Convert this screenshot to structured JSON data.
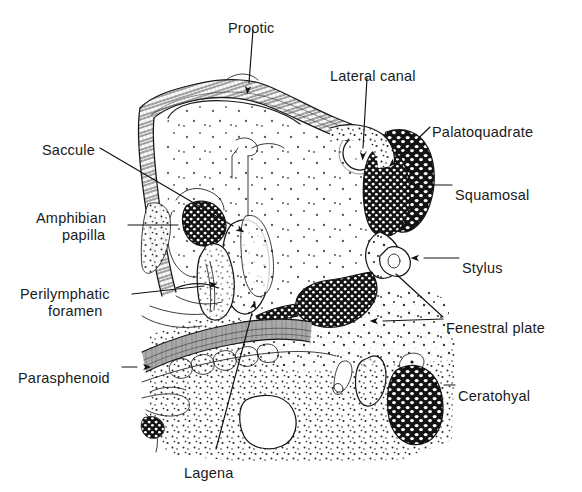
{
  "figure": {
    "kind": "scientific-line-illustration",
    "style": "black ink line drawing, stipple and hatch shading, white background",
    "width": 582,
    "height": 492,
    "background_color": "#ffffff",
    "ink_color": "#161616",
    "label_font_size_px": 14.5
  },
  "labels": [
    {
      "id": "prootic",
      "text": "Prootic",
      "x": 228,
      "y": 22,
      "anchor": "start",
      "leader": "M 253 30 L 249 83",
      "arrow": {
        "x": 248,
        "y": 86,
        "angle": 95
      }
    },
    {
      "id": "lateral-canal",
      "text": "Lateral canal",
      "x": 330,
      "y": 70,
      "anchor": "start",
      "leader": "M 367 78 L 363 148",
      "arrow": {
        "x": 363,
        "y": 152,
        "angle": 93
      }
    },
    {
      "id": "palatoquadrate",
      "text": "Palatoquadrate",
      "x": 432,
      "y": 126,
      "anchor": "start",
      "leader": "M 430 127 L 398 158",
      "arrow": {
        "x": 395,
        "y": 161,
        "angle": 136
      }
    },
    {
      "id": "squamosal",
      "text": "Squamosal",
      "x": 455,
      "y": 189,
      "anchor": "start",
      "leader": "M 452 185 L 425 185",
      "arrow": {
        "x": 421,
        "y": 185,
        "angle": 180
      }
    },
    {
      "id": "saccule",
      "text": "Saccule",
      "x": 42,
      "y": 144,
      "anchor": "start",
      "leader": "M 100 148 L 233 226",
      "arrow": {
        "x": 237,
        "y": 228,
        "angle": 30
      }
    },
    {
      "id": "amphibian-papilla",
      "text": "Amphibian",
      "text2": "papilla",
      "x": 36,
      "y": 212,
      "x2": 62,
      "y2": 229,
      "anchor": "start",
      "leader": "M 128 225 L 178 225",
      "arrow": {
        "x": 183,
        "y": 225,
        "angle": 0
      }
    },
    {
      "id": "perilymphatic-foramen",
      "text": "Perilymphatic",
      "text2": "foramen",
      "x": 20,
      "y": 288,
      "x2": 48,
      "y2": 305,
      "anchor": "start",
      "leader": "M 132 294 L 204 286",
      "arrow": {
        "x": 209,
        "y": 285,
        "angle": -6
      }
    },
    {
      "id": "parasphenoid",
      "text": "Parasphenoid",
      "x": 18,
      "y": 372,
      "anchor": "start",
      "leader": "M 122 367 L 137 367",
      "arrow": {
        "x": 143,
        "y": 367,
        "angle": 0
      }
    },
    {
      "id": "fenestral-plate",
      "text": "Fenestral  plate",
      "x": 446,
      "y": 322,
      "anchor": "start",
      "leader": "M 443 317 L 396 274 M 443 319 L 383 321",
      "arrow": {
        "x": 378,
        "y": 321,
        "angle": 180
      }
    },
    {
      "id": "stylus",
      "text": "Stylus",
      "x": 462,
      "y": 262,
      "anchor": "start",
      "leader": "M 459 258 L 424 258",
      "arrow": {
        "x": 419,
        "y": 258,
        "angle": 180
      }
    },
    {
      "id": "ceratohyal",
      "text": "Ceratohyal",
      "x": 458,
      "y": 390,
      "anchor": "start",
      "leader": "M 455 385 L 444 385",
      "arrow": {
        "x": 438,
        "y": 385,
        "angle": 180
      }
    },
    {
      "id": "lagena",
      "text": "Lagena",
      "x": 184,
      "y": 467,
      "anchor": "start",
      "leader": "M 252 313 L 216 449",
      "arrow": {
        "x": 253,
        "y": 309,
        "angle": -75
      }
    }
  ],
  "structures": [
    {
      "id": "otic-capsule-chamber",
      "type": "stippled-cavity",
      "note": "large pale chamber, sparse stipple"
    },
    {
      "id": "prootic-bone",
      "type": "hatched-bone",
      "note": "striated lamellar bone across dorsal margin"
    },
    {
      "id": "palatoquadrate-cartilage",
      "type": "cell-cartilage",
      "note": "dark matrix with white lacunae"
    },
    {
      "id": "squamosal-cartilage",
      "type": "cell-cartilage"
    },
    {
      "id": "lateral-canal-lumen",
      "type": "circle-lumen"
    },
    {
      "id": "amphibian-papilla-body",
      "type": "cell-cartilage"
    },
    {
      "id": "saccule-chamber",
      "type": "stippled-cavity"
    },
    {
      "id": "lagena-chamber",
      "type": "stippled-cavity"
    },
    {
      "id": "perilymphatic-foramen-opening",
      "type": "outline-opening"
    },
    {
      "id": "parasphenoid-bone",
      "type": "hatched-bone",
      "note": "horizontal striated band, ventral"
    },
    {
      "id": "fenestral-plate-cartilage",
      "type": "cell-cartilage"
    },
    {
      "id": "stylus-process",
      "type": "outline-process"
    },
    {
      "id": "ceratohyal-cartilage",
      "type": "cell-cartilage",
      "note": "dense dark oval, lower right"
    },
    {
      "id": "connective-tissue-field",
      "type": "stipple-field",
      "note": "broad stippled ground, ventral half"
    }
  ]
}
